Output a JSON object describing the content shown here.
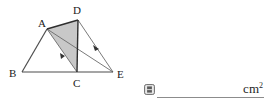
{
  "figure": {
    "shaded_region_label": "ADC",
    "points": [
      {
        "name": "A",
        "label": "A",
        "x": 47,
        "y": 29,
        "label_x": 38,
        "label_y": 24
      },
      {
        "name": "B",
        "label": "B",
        "x": 22,
        "y": 72,
        "label_x": 10,
        "label_y": 76
      },
      {
        "name": "C",
        "label": "C",
        "x": 77,
        "y": 72,
        "label_x": 73,
        "label_y": 86
      },
      {
        "name": "D",
        "label": "D",
        "x": 78,
        "y": 20,
        "label_x": 73,
        "label_y": 14
      },
      {
        "name": "E",
        "label": "E",
        "x": 113,
        "y": 72,
        "label_x": 117,
        "label_y": 77
      }
    ],
    "segments": [
      {
        "name": "segment-AB",
        "from": "A",
        "to": "B"
      },
      {
        "name": "segment-BC",
        "from": "B",
        "to": "C"
      },
      {
        "name": "segment-CE",
        "from": "C",
        "to": "E"
      },
      {
        "name": "segment-AD",
        "from": "A",
        "to": "D"
      },
      {
        "name": "segment-DC",
        "from": "D",
        "to": "C"
      },
      {
        "name": "segment-AC",
        "from": "A",
        "to": "C"
      },
      {
        "name": "segment-AE",
        "from": "A",
        "to": "E"
      },
      {
        "name": "segment-DE",
        "from": "D",
        "to": "E"
      }
    ],
    "parallel_marks": [
      {
        "name": "parallel-mark-AC",
        "on_segment": "segment-AC",
        "t": 0.62
      },
      {
        "name": "parallel-mark-DE",
        "on_segment": "segment-DE",
        "t": 0.55
      }
    ],
    "colors": {
      "stroke": "#4d4d4d",
      "shade_fill": "#c8c8c8",
      "shade_stroke": "#404040",
      "label": "#1a1a1a"
    }
  },
  "answer": {
    "icon": "answer-box-icon",
    "value": "",
    "placeholder": "",
    "unit": "cm",
    "unit_exponent": "2",
    "rule_color": "#8c8c8c"
  }
}
